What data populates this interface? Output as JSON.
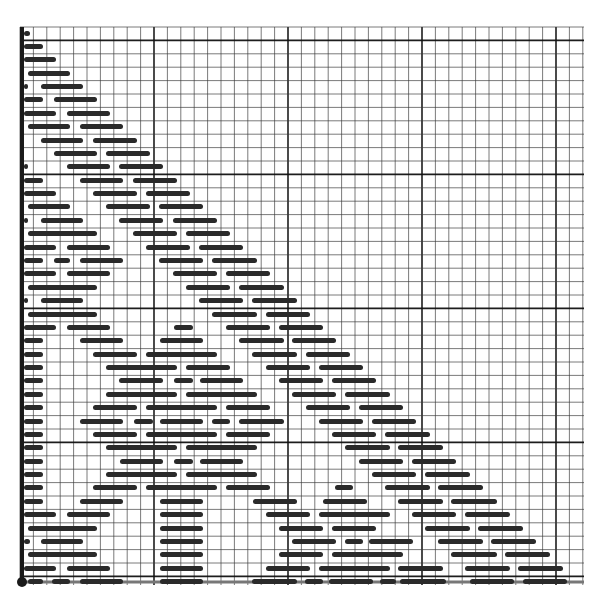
{
  "figure": {
    "grid": {
      "left": 20,
      "top": 27,
      "right": 584,
      "bottom": 585,
      "cell": 13.4,
      "major_every": 10,
      "minor_color": "#3a3a3a",
      "major_color": "#111111",
      "axis_color": "#1a1a1a"
    },
    "bar_color": "#2a2a2a",
    "row_y0": 33,
    "row_pitch": 13.38,
    "rows": [
      [
        [
          24,
          30
        ]
      ],
      [
        [
          24,
          43
        ]
      ],
      [
        [
          24,
          56
        ]
      ],
      [
        [
          28,
          70
        ]
      ],
      [
        [
          24,
          28
        ],
        [
          41,
          83
        ]
      ],
      [
        [
          24,
          43
        ],
        [
          54,
          97
        ]
      ],
      [
        [
          24,
          56
        ],
        [
          67,
          110
        ]
      ],
      [
        [
          28,
          70
        ],
        [
          80,
          123
        ]
      ],
      [
        [
          41,
          83
        ],
        [
          93,
          137
        ]
      ],
      [
        [
          54,
          97
        ],
        [
          106,
          150
        ]
      ],
      [
        [
          24,
          28
        ],
        [
          67,
          110
        ],
        [
          119,
          163
        ]
      ],
      [
        [
          24,
          43
        ],
        [
          80,
          123
        ],
        [
          133,
          177
        ]
      ],
      [
        [
          24,
          56
        ],
        [
          93,
          137
        ],
        [
          146,
          190
        ]
      ],
      [
        [
          28,
          70
        ],
        [
          106,
          150
        ],
        [
          159,
          203
        ]
      ],
      [
        [
          24,
          28
        ],
        [
          41,
          83
        ],
        [
          119,
          163
        ],
        [
          173,
          217
        ]
      ],
      [
        [
          28,
          97
        ],
        [
          133,
          177
        ],
        [
          186,
          230
        ]
      ],
      [
        [
          24,
          56
        ],
        [
          67,
          110
        ],
        [
          146,
          190
        ],
        [
          199,
          243
        ]
      ],
      [
        [
          24,
          43
        ],
        [
          54,
          70
        ],
        [
          80,
          123
        ],
        [
          159,
          203
        ],
        [
          212,
          257
        ]
      ],
      [
        [
          24,
          56
        ],
        [
          67,
          110
        ],
        [
          173,
          217
        ],
        [
          226,
          270
        ]
      ],
      [
        [
          28,
          97
        ],
        [
          186,
          230
        ],
        [
          239,
          284
        ]
      ],
      [
        [
          24,
          28
        ],
        [
          41,
          83
        ],
        [
          199,
          243
        ],
        [
          252,
          297
        ]
      ],
      [
        [
          28,
          97
        ],
        [
          212,
          257
        ],
        [
          266,
          310
        ]
      ],
      [
        [
          24,
          56
        ],
        [
          67,
          110
        ],
        [
          174,
          193
        ],
        [
          226,
          270
        ],
        [
          279,
          323
        ]
      ],
      [
        [
          24,
          43
        ],
        [
          80,
          123
        ],
        [
          160,
          203
        ],
        [
          239,
          284
        ],
        [
          292,
          336
        ]
      ],
      [
        [
          24,
          43
        ],
        [
          93,
          137
        ],
        [
          146,
          217
        ],
        [
          252,
          297
        ],
        [
          306,
          350
        ]
      ],
      [
        [
          24,
          43
        ],
        [
          106,
          177
        ],
        [
          186,
          230
        ],
        [
          266,
          310
        ],
        [
          319,
          363
        ]
      ],
      [
        [
          24,
          43
        ],
        [
          119,
          163
        ],
        [
          174,
          193
        ],
        [
          200,
          243
        ],
        [
          279,
          323
        ],
        [
          332,
          376
        ]
      ],
      [
        [
          24,
          43
        ],
        [
          106,
          177
        ],
        [
          186,
          257
        ],
        [
          292,
          336
        ],
        [
          345,
          390
        ]
      ],
      [
        [
          24,
          43
        ],
        [
          93,
          137
        ],
        [
          146,
          217
        ],
        [
          226,
          270
        ],
        [
          306,
          350
        ],
        [
          359,
          403
        ]
      ],
      [
        [
          24,
          43
        ],
        [
          80,
          123
        ],
        [
          134,
          153
        ],
        [
          160,
          203
        ],
        [
          212,
          230
        ],
        [
          239,
          284
        ],
        [
          319,
          363
        ],
        [
          372,
          416
        ]
      ],
      [
        [
          24,
          43
        ],
        [
          93,
          137
        ],
        [
          146,
          217
        ],
        [
          226,
          270
        ],
        [
          332,
          376
        ],
        [
          385,
          430
        ]
      ],
      [
        [
          24,
          43
        ],
        [
          106,
          177
        ],
        [
          186,
          257
        ],
        [
          345,
          390
        ],
        [
          398,
          443
        ]
      ],
      [
        [
          24,
          43
        ],
        [
          120,
          163
        ],
        [
          174,
          193
        ],
        [
          200,
          243
        ],
        [
          359,
          403
        ],
        [
          412,
          456
        ]
      ],
      [
        [
          24,
          43
        ],
        [
          106,
          177
        ],
        [
          186,
          257
        ],
        [
          372,
          416
        ],
        [
          425,
          470
        ]
      ],
      [
        [
          24,
          43
        ],
        [
          93,
          137
        ],
        [
          146,
          217
        ],
        [
          226,
          270
        ],
        [
          335,
          353
        ],
        [
          385,
          430
        ],
        [
          438,
          483
        ]
      ],
      [
        [
          24,
          43
        ],
        [
          80,
          123
        ],
        [
          160,
          203
        ],
        [
          253,
          297
        ],
        [
          323,
          367
        ],
        [
          398,
          443
        ],
        [
          451,
          497
        ]
      ],
      [
        [
          24,
          56
        ],
        [
          67,
          110
        ],
        [
          160,
          203
        ],
        [
          266,
          310
        ],
        [
          319,
          390
        ],
        [
          412,
          456
        ],
        [
          465,
          510
        ]
      ],
      [
        [
          28,
          97
        ],
        [
          160,
          203
        ],
        [
          279,
          323
        ],
        [
          332,
          376
        ],
        [
          425,
          470
        ],
        [
          478,
          523
        ]
      ],
      [
        [
          24,
          30
        ],
        [
          41,
          83
        ],
        [
          160,
          203
        ],
        [
          292,
          336
        ],
        [
          345,
          363
        ],
        [
          369,
          413
        ],
        [
          438,
          483
        ],
        [
          491,
          536
        ]
      ],
      [
        [
          28,
          97
        ],
        [
          160,
          203
        ],
        [
          279,
          323
        ],
        [
          332,
          403
        ],
        [
          451,
          497
        ],
        [
          505,
          550
        ]
      ],
      [
        [
          24,
          56
        ],
        [
          67,
          110
        ],
        [
          160,
          203
        ],
        [
          266,
          310
        ],
        [
          319,
          390
        ],
        [
          398,
          443
        ],
        [
          465,
          510
        ],
        [
          518,
          563
        ]
      ],
      [
        [
          28,
          43
        ],
        [
          52,
          70
        ],
        [
          80,
          123
        ],
        [
          160,
          203
        ],
        [
          252,
          297
        ],
        [
          305,
          323
        ],
        [
          329,
          373
        ],
        [
          380,
          396
        ],
        [
          400,
          446
        ],
        [
          470,
          514
        ],
        [
          523,
          567
        ]
      ]
    ],
    "origin_dot": {
      "x": 22,
      "y": 582,
      "r": 5
    }
  }
}
